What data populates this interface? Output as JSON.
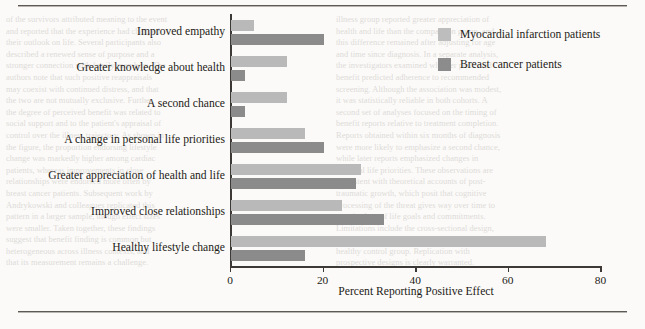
{
  "page": {
    "background_color": "#fbfaf8",
    "rule_color": "#5d5a56",
    "bleed_text_left": [
      "of the survivors attributed meaning to the event",
      "and reported that the experience had changed",
      "their outlook on life. Several participants also",
      "described a renewed sense of purpose and a",
      "stronger connection with family members. The",
      "authors note that such positive reappraisals",
      "may coexist with continued distress, and that",
      "the two are not mutually exclusive. Further,",
      "the degree of perceived benefit was related to",
      "social support and to the patient's appraisal of",
      "control over the illness trajectory. As shown in",
      "the figure, the proportion endorsing lifestyle",
      "change was markedly higher among cardiac",
      "patients, whereas improvements in close",
      "relationships were endorsed more often by",
      "breast cancer patients. Subsequent work by",
      "Andrykowski and colleagues replicated this",
      "pattern in a larger sample, though effect sizes",
      "were smaller. Taken together, these findings",
      "suggest that benefit finding is common but",
      "heterogeneous across illness contexts, and",
      "that its measurement remains a challenge."
    ],
    "bleed_text_right": [
      "illness group reported greater appreciation of",
      "health and life than the comparison group, and",
      "this difference remained after adjusting for age",
      "and time since diagnosis. In a separate analysis,",
      "the investigators examined whether perceived",
      "benefit predicted adherence to recommended",
      "screening. Although the association was modest,",
      "it was statistically reliable in both cohorts. A",
      "second set of analyses focused on the timing of",
      "benefit reports relative to treatment completion.",
      "Reports obtained within six months of diagnosis",
      "were more likely to emphasize a second chance,",
      "while later reports emphasized changes in",
      "personal life priorities. These observations are",
      "consistent with theoretical accounts of post-",
      "traumatic growth, which posit that cognitive",
      "processing of the threat gives way over time to",
      "a revised set of life goals and commitments.",
      "Limitations include the cross-sectional design,",
      "reliance on self-report, and the absence of a",
      "healthy control group. Replication with",
      "prospective designs is clearly warranted."
    ]
  },
  "chart_data": {
    "type": "bar",
    "orientation": "horizontal",
    "grouped": true,
    "title": "",
    "xlabel": "Percent Reporting Positive Effect",
    "ylabel": "",
    "xlim": [
      0,
      80
    ],
    "xticks": [
      0,
      20,
      40,
      60,
      80
    ],
    "xtick_labels": [
      "0",
      "20",
      "40",
      "60",
      "80"
    ],
    "grid": false,
    "legend_position": "top-right",
    "categories": [
      "Improved empathy",
      "Greater knowledge about health",
      "A second chance",
      "A change in personal life priorities",
      "Greater appreciation of health and life",
      "Improved close relationships",
      "Healthy lifestyle change"
    ],
    "series": [
      {
        "name": "Myocardial infarction patients",
        "color": "#b9b9b9",
        "values": [
          5,
          12,
          12,
          16,
          28,
          24,
          68
        ]
      },
      {
        "name": "Breast cancer patients",
        "color": "#8b8b8b",
        "values": [
          20,
          3,
          3,
          20,
          27,
          33,
          16
        ]
      }
    ]
  }
}
